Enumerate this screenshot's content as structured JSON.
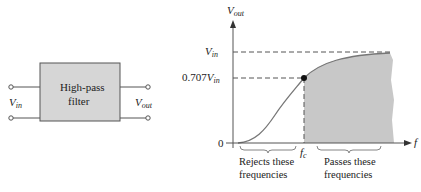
{
  "block_diagram": {
    "box_label_line1": "High-pass",
    "box_label_line2": "filter",
    "input_label": {
      "main": "V",
      "sub": "in"
    },
    "output_label": {
      "main": "V",
      "sub": "out"
    }
  },
  "chart": {
    "y_axis_label": {
      "main": "V",
      "sub": "out"
    },
    "x_axis_label": "f",
    "y_tick_vin": {
      "main": "V",
      "sub": "in"
    },
    "y_tick_0707": {
      "prefix": "0.707",
      "main": "V",
      "sub": "in"
    },
    "y_tick_zero": "0",
    "x_tick_fc": {
      "main": "f",
      "sub": "c"
    },
    "reject_label_line1": "Rejects these",
    "reject_label_line2": "frequencies",
    "pass_label_line1": "Passes these",
    "pass_label_line2": "frequencies",
    "fill_color": "#c8c8c8",
    "curve_color": "#777777"
  }
}
